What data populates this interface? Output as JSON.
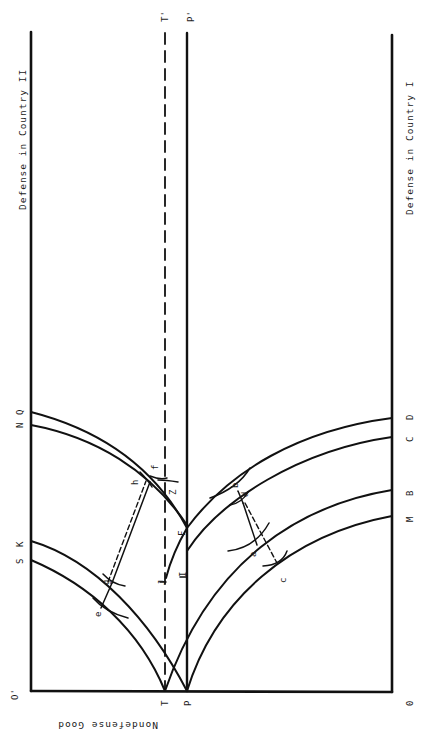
{
  "diagram": {
    "title_axes": {
      "top_axis_label": "Defense in Country II",
      "bottom_axis_label": "Defense in Country I",
      "vertical_axis_label": "Nondefense Good"
    },
    "origin_labels": {
      "origin_country_I": "0",
      "origin_country_II": "O'"
    },
    "line_labels": {
      "T_bottom": "T",
      "T_top": "T'",
      "P_bottom": "P",
      "P_top": "P'"
    },
    "left_curve_labels": [
      "S",
      "K",
      "N",
      "Q"
    ],
    "right_curve_labels": [
      "M",
      "B",
      "C",
      "D"
    ],
    "point_labels": {
      "a": "a",
      "b": "b",
      "c": "c",
      "d": "d",
      "e": "e",
      "g": "g",
      "h": "h",
      "f": "f",
      "J": "J",
      "I": "I",
      "F": "F",
      "Z": "Z"
    },
    "colors": {
      "ink": "#111111",
      "background": "#ffffff"
    }
  }
}
